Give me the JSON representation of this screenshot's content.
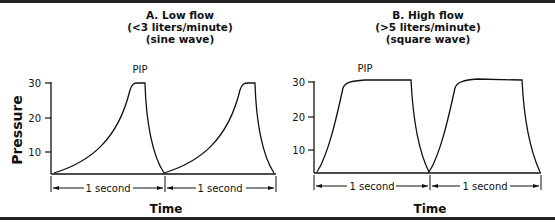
{
  "panels": [
    {
      "id": "A",
      "title_line1": "A. Low flow",
      "title_line2": "(<3 liters/minute)",
      "title_line3": "(sine wave)",
      "peak_label": "PIP",
      "y_ticks": [
        "30",
        "20",
        "10"
      ],
      "interval_labels": [
        "1 second",
        "1 second"
      ],
      "x_axis_label": "Time",
      "waveform": "sine"
    },
    {
      "id": "B",
      "title_line1": "B. High flow",
      "title_line2": "(>5 liters/minute)",
      "title_line3": "(square wave)",
      "peak_label": "PIP",
      "y_ticks": [
        "30",
        "20",
        "10"
      ],
      "interval_labels": [
        "1 second",
        "1 second"
      ],
      "x_axis_label": "Time",
      "waveform": "square"
    }
  ],
  "y_axis_label": "Pressure",
  "colors": {
    "line": "#111111",
    "frame": "#222222",
    "background": "#ffffff"
  }
}
